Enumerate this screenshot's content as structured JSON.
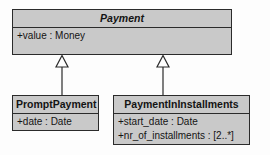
{
  "diagram": {
    "kind": "uml-class-diagram",
    "colors": {
      "canvas": "#fdfdfd",
      "box_fill": "#c9c9c9",
      "line": "#2b2b2b",
      "text": "#141414",
      "arrowhead_fill": "#ffffff"
    },
    "classes": [
      {
        "id": "payment",
        "name": "Payment",
        "abstract": true,
        "attributes": [
          "+value : Money"
        ]
      },
      {
        "id": "prompt-payment",
        "name": "PromptPayment",
        "abstract": false,
        "attributes": [
          "+date : Date"
        ]
      },
      {
        "id": "payment-in-installments",
        "name": "PaymentInInstallments",
        "abstract": false,
        "attributes": [
          "+start_date : Date",
          "+nr_of_installments : [2..*]"
        ]
      }
    ],
    "relationships": [
      {
        "type": "generalization",
        "source": "PromptPayment",
        "target": "Payment",
        "arrowhead": "hollow-triangle"
      },
      {
        "type": "generalization",
        "source": "PaymentInInstallments",
        "target": "Payment",
        "arrowhead": "hollow-triangle"
      }
    ]
  }
}
